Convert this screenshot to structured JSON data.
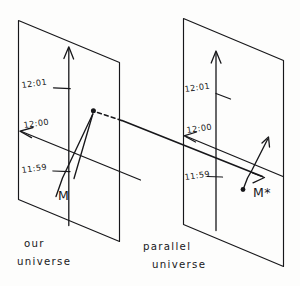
{
  "figure": {
    "ink_color": "#17171a",
    "paper_color": "#fdfdfc"
  },
  "panels": [
    {
      "id": "our-universe",
      "caption_line1": "our",
      "caption_line2": "universe",
      "time_axis": {
        "name": "vertical time axis",
        "direction": "up",
        "ticks": [
          {
            "label": "12:01"
          },
          {
            "label": "12:00"
          },
          {
            "label": "11:59"
          }
        ]
      },
      "mass_label": "M"
    },
    {
      "id": "parallel-universe",
      "caption_line1": "parallel",
      "caption_line2": "universe",
      "time_axis": {
        "name": "vertical time axis",
        "direction": "up",
        "ticks": [
          {
            "label": "12:01"
          },
          {
            "label": "12:00"
          },
          {
            "label": "11:59"
          }
        ]
      },
      "mass_label": "M*"
    }
  ],
  "annotations": {
    "event_dot_left": "event point on left worldline",
    "event_dot_right": "event point on right worldline",
    "dashed_connector": "dashed segment leaving left event",
    "bridge": "line connecting the two universes"
  }
}
